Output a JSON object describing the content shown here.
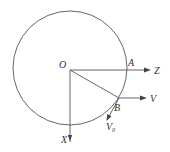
{
  "diagram": {
    "type": "geometry-vector-diagram",
    "circle": {
      "cx": 70,
      "cy": 68,
      "r": 57
    },
    "points": {
      "O": {
        "label": "O",
        "x": 70,
        "y": 70
      },
      "A": {
        "label": "A",
        "x": 127,
        "y": 70
      },
      "B": {
        "label": "B",
        "x": 119,
        "y": 98
      }
    },
    "axes": {
      "Z": {
        "label": "Z",
        "direction": "right"
      },
      "X": {
        "label": "X",
        "direction": "down"
      }
    },
    "vectors": {
      "V": {
        "label": "V",
        "from": "B",
        "direction": "right"
      },
      "V0": {
        "label": "V",
        "subscript": "0",
        "from": "B",
        "direction": "tangent-down-left"
      }
    },
    "segments": [
      {
        "from": "O",
        "to": "B",
        "name": "radius-OB"
      }
    ],
    "colors": {
      "line": "#555555",
      "text": "#333333",
      "background": "#ffffff"
    }
  }
}
